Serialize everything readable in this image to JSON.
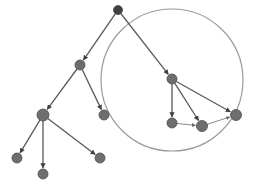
{
  "diagram": {
    "type": "tree-graph",
    "colors": {
      "background": "#ffffff",
      "node_fill": "#6e6e6e",
      "node_stroke": "#4a4a4a",
      "root_fill": "#3f3f3f",
      "edge": "#5a5a5a",
      "light_edge": "#8a8a8a",
      "circle": "#9a9a9a"
    },
    "highlight_circle": {
      "cx": 172,
      "cy": 80,
      "r": 71
    },
    "nodes": [
      {
        "id": "root",
        "x": 118,
        "y": 10,
        "r": 4.5,
        "root": true
      },
      {
        "id": "a",
        "x": 80,
        "y": 65,
        "r": 5
      },
      {
        "id": "b",
        "x": 172,
        "y": 79,
        "r": 5
      },
      {
        "id": "c",
        "x": 43,
        "y": 115,
        "r": 6
      },
      {
        "id": "d",
        "x": 104,
        "y": 115,
        "r": 5
      },
      {
        "id": "e",
        "x": 172,
        "y": 123,
        "r": 5
      },
      {
        "id": "f",
        "x": 202,
        "y": 126,
        "r": 5.5
      },
      {
        "id": "g",
        "x": 236,
        "y": 115,
        "r": 5.5
      },
      {
        "id": "h",
        "x": 17,
        "y": 158,
        "r": 5
      },
      {
        "id": "i",
        "x": 43,
        "y": 174,
        "r": 5
      },
      {
        "id": "j",
        "x": 100,
        "y": 158,
        "r": 5
      }
    ],
    "edges": [
      {
        "from": "root",
        "to": "a"
      },
      {
        "from": "root",
        "to": "b"
      },
      {
        "from": "a",
        "to": "c"
      },
      {
        "from": "a",
        "to": "d"
      },
      {
        "from": "c",
        "to": "h"
      },
      {
        "from": "c",
        "to": "i"
      },
      {
        "from": "c",
        "to": "j"
      },
      {
        "from": "b",
        "to": "e"
      },
      {
        "from": "b",
        "to": "f"
      },
      {
        "from": "b",
        "to": "g"
      },
      {
        "from": "e",
        "to": "f",
        "light": true
      },
      {
        "from": "f",
        "to": "g",
        "light": true
      }
    ]
  }
}
